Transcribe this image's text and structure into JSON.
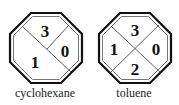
{
  "diagrams": [
    {
      "label": "cyclohexane",
      "layout": "three-section",
      "sections": {
        "top": "3",
        "right": "0",
        "left": "1"
      }
    },
    {
      "label": "toluene",
      "layout": "four-section",
      "sections": {
        "top": "3",
        "right": "0",
        "left": "1",
        "bottom": "2"
      }
    }
  ],
  "colors": {
    "stroke": "#111111",
    "background": "#ffffff",
    "text": "#111111"
  }
}
